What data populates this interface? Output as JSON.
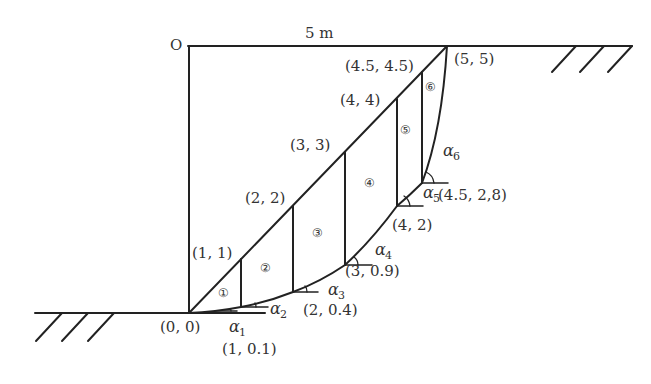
{
  "diagram": {
    "origin_label": "O",
    "width_label": "5 m",
    "points": [
      {
        "id": "p00",
        "label": "(0, 0)"
      },
      {
        "id": "p11",
        "label": "(1, 1)"
      },
      {
        "id": "p22",
        "label": "(2, 2)"
      },
      {
        "id": "p33",
        "label": "(3, 3)"
      },
      {
        "id": "p44",
        "label": "(4, 4)"
      },
      {
        "id": "p4545",
        "label": "(4.5, 4.5)"
      },
      {
        "id": "p55",
        "label": "(5, 5)"
      },
      {
        "id": "p101",
        "label": "(1, 0.1)"
      },
      {
        "id": "p204",
        "label": "(2, 0.4)"
      },
      {
        "id": "p309",
        "label": "(3, 0.9)"
      },
      {
        "id": "p42",
        "label": "(4, 2)"
      },
      {
        "id": "p4528",
        "label": "(4.5, 2,8)"
      }
    ],
    "slices": [
      "①",
      "②",
      "③",
      "④",
      "⑤",
      "⑥"
    ],
    "angles": [
      {
        "symbol": "α",
        "sub": "1"
      },
      {
        "symbol": "α",
        "sub": "2"
      },
      {
        "symbol": "α",
        "sub": "3"
      },
      {
        "symbol": "α",
        "sub": "4"
      },
      {
        "symbol": "α",
        "sub": "5"
      },
      {
        "symbol": "α",
        "sub": "6"
      }
    ],
    "colors": {
      "line": "#222222",
      "text": "#333333",
      "background": "#ffffff"
    }
  }
}
